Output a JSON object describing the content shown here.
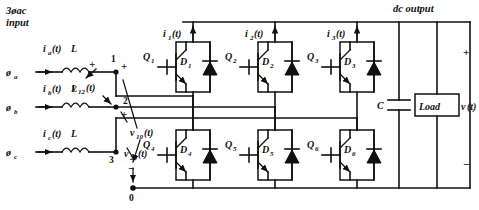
{
  "figure": {
    "type": "three-phase-voltage-source-rectifier-schematic",
    "input_title_line1": "3øac",
    "input_title_line2": "input",
    "output_title": "dc output"
  },
  "sources": [
    {
      "phase_label": "ø",
      "phase_sub": "a",
      "current": "i",
      "current_sub": "a",
      "current_arg": "(t)",
      "inductor": "L",
      "node": "1"
    },
    {
      "phase_label": "ø",
      "phase_sub": "b",
      "current": "i",
      "current_sub": "b",
      "current_arg": "(t)",
      "inductor": "L",
      "node": "2"
    },
    {
      "phase_label": "ø",
      "phase_sub": "c",
      "current": "i",
      "current_sub": "c",
      "current_arg": "(t)",
      "inductor": "L",
      "node": "3"
    }
  ],
  "nodes": {
    "n1": "1",
    "n2": "2",
    "n3": "3",
    "n0": "0"
  },
  "voltages": [
    {
      "name": "v",
      "sub": "12",
      "arg": "(t)"
    },
    {
      "name": "v",
      "sub": "10",
      "arg": "(t)"
    },
    {
      "name": "v",
      "sub": "20",
      "arg": "(t)"
    }
  ],
  "leg_currents": [
    {
      "name": "i",
      "sub": "1",
      "arg": "(t)"
    },
    {
      "name": "i",
      "sub": "2",
      "arg": "(t)"
    },
    {
      "name": "i",
      "sub": "3",
      "arg": "(t)"
    }
  ],
  "switches_upper": [
    {
      "transistor": "Q",
      "transistor_sub": "1",
      "diode": "D",
      "diode_sub": "1"
    },
    {
      "transistor": "Q",
      "transistor_sub": "2",
      "diode": "D",
      "diode_sub": "2"
    },
    {
      "transistor": "Q",
      "transistor_sub": "3",
      "diode": "D",
      "diode_sub": "3"
    }
  ],
  "switches_lower": [
    {
      "transistor": "Q",
      "transistor_sub": "4",
      "diode": "D",
      "diode_sub": "4"
    },
    {
      "transistor": "Q",
      "transistor_sub": "5",
      "diode": "D",
      "diode_sub": "5"
    },
    {
      "transistor": "Q",
      "transistor_sub": "6",
      "diode": "D",
      "diode_sub": "6"
    }
  ],
  "output_stage": {
    "capacitor_label": "C",
    "load_label": "Load",
    "output_voltage": "v",
    "output_voltage_arg": "(t)",
    "polarity_plus": "+",
    "polarity_minus": "−"
  },
  "polarity_marks": {
    "plus": "+",
    "minus": "−"
  },
  "colors": {
    "line": "#111111",
    "background": "#ffffff"
  }
}
